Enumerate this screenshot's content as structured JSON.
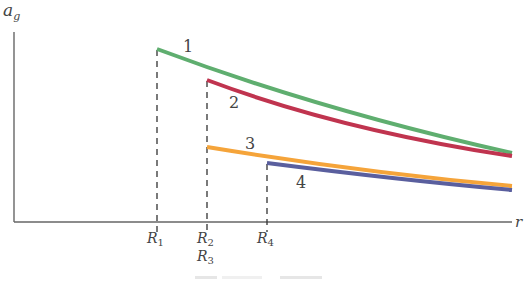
{
  "diagram": {
    "axes": {
      "y_label": "a",
      "y_label_sub": "g",
      "x_label": "r",
      "color": "#555555"
    },
    "ticks": [
      {
        "name": "R",
        "sub": "1",
        "x": 157
      },
      {
        "name": "R",
        "sub": "2",
        "x": 207
      },
      {
        "name": "R",
        "sub": "4",
        "x": 267
      }
    ],
    "extra_tick_label": {
      "name": "R",
      "sub": "3",
      "x": 207
    },
    "curves": [
      {
        "id": "1",
        "label": "1",
        "color": "#5fae6f",
        "start": [
          157,
          49
        ],
        "ctrl": [
          320,
          110
        ],
        "end": [
          512,
          153
        ],
        "label_pos": [
          183,
          52
        ]
      },
      {
        "id": "2",
        "label": "2",
        "color": "#c0344f",
        "start": [
          207,
          80
        ],
        "ctrl": [
          340,
          130
        ],
        "end": [
          512,
          156
        ],
        "label_pos": [
          229,
          108
        ]
      },
      {
        "id": "3",
        "label": "3",
        "color": "#f5a43a",
        "start": [
          207,
          147
        ],
        "ctrl": [
          360,
          172
        ],
        "end": [
          512,
          186
        ],
        "label_pos": [
          245,
          149
        ]
      },
      {
        "id": "4",
        "label": "4",
        "color": "#5a5f9e",
        "start": [
          267,
          163
        ],
        "ctrl": [
          400,
          180
        ],
        "end": [
          512,
          190
        ],
        "label_pos": [
          296,
          188
        ]
      }
    ]
  }
}
